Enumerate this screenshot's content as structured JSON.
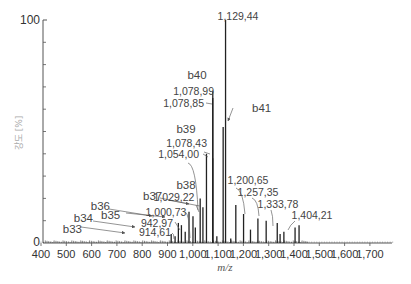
{
  "chart_data": {
    "type": "bar",
    "subtype": "mass-spectrum-stick",
    "title": "",
    "xlabel": "m/z",
    "ylabel": "강도 [%]",
    "xlim": [
      400,
      1800
    ],
    "ylim": [
      0,
      100
    ],
    "x_ticks": [
      400,
      500,
      600,
      700,
      800,
      900,
      1000,
      1100,
      1200,
      1300,
      1400,
      1500,
      1600,
      1700
    ],
    "x_tick_labels": [
      "400",
      "500",
      "600",
      "700",
      "800",
      "900",
      "1,000",
      "1,100",
      "1,200",
      "1,300",
      "1,400",
      "1,500",
      "1,600",
      "1,700"
    ],
    "y_tick_labels": [
      "0",
      "100"
    ],
    "grid": false,
    "labeled_peaks": [
      {
        "mz": 914.61,
        "label": "914,61",
        "intensity": 4,
        "ion": "b33"
      },
      {
        "mz": 942.97,
        "label": "942,97",
        "intensity": 9,
        "ion": "b34"
      },
      {
        "mz": 1000.73,
        "label": "1,000,73",
        "intensity": 12,
        "ion": "b35"
      },
      {
        "mz": 1029.22,
        "label": "1,029,22",
        "intensity": 20,
        "ion": "b37"
      },
      {
        "mz": 1054.0,
        "label": "1,054,00",
        "intensity": 40,
        "ion": "b38"
      },
      {
        "mz": 1078.43,
        "label": "1,078,43",
        "intensity": 38,
        "ion": "b39"
      },
      {
        "mz": 1078.85,
        "label": "1,078,85",
        "intensity": 65,
        "ion": ""
      },
      {
        "mz": 1078.99,
        "label": "1,078,99",
        "intensity": 68,
        "ion": "b40"
      },
      {
        "mz": 1129.44,
        "label": "1,129,44",
        "intensity": 100,
        "ion": ""
      },
      {
        "mz": 1120.0,
        "label": "",
        "intensity": 52,
        "ion": "b41"
      },
      {
        "mz": 1200.65,
        "label": "1,200,65",
        "intensity": 13,
        "ion": ""
      },
      {
        "mz": 1257.35,
        "label": "1,257,35",
        "intensity": 11,
        "ion": ""
      },
      {
        "mz": 1333.78,
        "label": "1,333,78",
        "intensity": 9,
        "ion": ""
      },
      {
        "mz": 1404.21,
        "label": "1,404,21",
        "intensity": 7,
        "ion": ""
      }
    ],
    "ion_labels": [
      "b33",
      "b34",
      "b35",
      "b36",
      "b37",
      "b38",
      "b39",
      "b40",
      "b41"
    ],
    "minor_peaks": [
      {
        "mz": 930,
        "intensity": 3
      },
      {
        "mz": 955,
        "intensity": 8
      },
      {
        "mz": 970,
        "intensity": 5
      },
      {
        "mz": 985,
        "intensity": 14
      },
      {
        "mz": 1010,
        "intensity": 7
      },
      {
        "mz": 1040,
        "intensity": 16
      },
      {
        "mz": 1095,
        "intensity": 3
      },
      {
        "mz": 1150,
        "intensity": 2
      },
      {
        "mz": 1170,
        "intensity": 17
      },
      {
        "mz": 1228,
        "intensity": 6
      },
      {
        "mz": 1290,
        "intensity": 10
      },
      {
        "mz": 1345,
        "intensity": 4
      },
      {
        "mz": 1360,
        "intensity": 5
      },
      {
        "mz": 1420,
        "intensity": 8
      }
    ]
  },
  "axes": {
    "y_top": "100",
    "y_bottom": "0",
    "xlabel": "m/z",
    "ylabel": "강도 [%]"
  },
  "annotations": {
    "p1129": "1,129,44",
    "b40": "b40",
    "p1078_99": "1,078,99",
    "p1078_85": "1,078,85",
    "b41": "b41",
    "b39": "b39",
    "p1078_43": "1,078,43",
    "p1054": "1,054,00",
    "b38": "b38",
    "p1029": "1,029,22",
    "b37": "b37",
    "b36": "b36",
    "p1000": "1,000,73",
    "b35": "b35",
    "p942": "942,97",
    "b34": "b34",
    "b33": "b33",
    "p914": "914,61",
    "p1200": "1,200,65",
    "p1257": "1,257,35",
    "p1333": "1,333,78",
    "p1404": "1,404,21"
  },
  "colors": {
    "axis": "#555555",
    "peak": "#222222",
    "text": "#444444",
    "leader": "#666666"
  }
}
